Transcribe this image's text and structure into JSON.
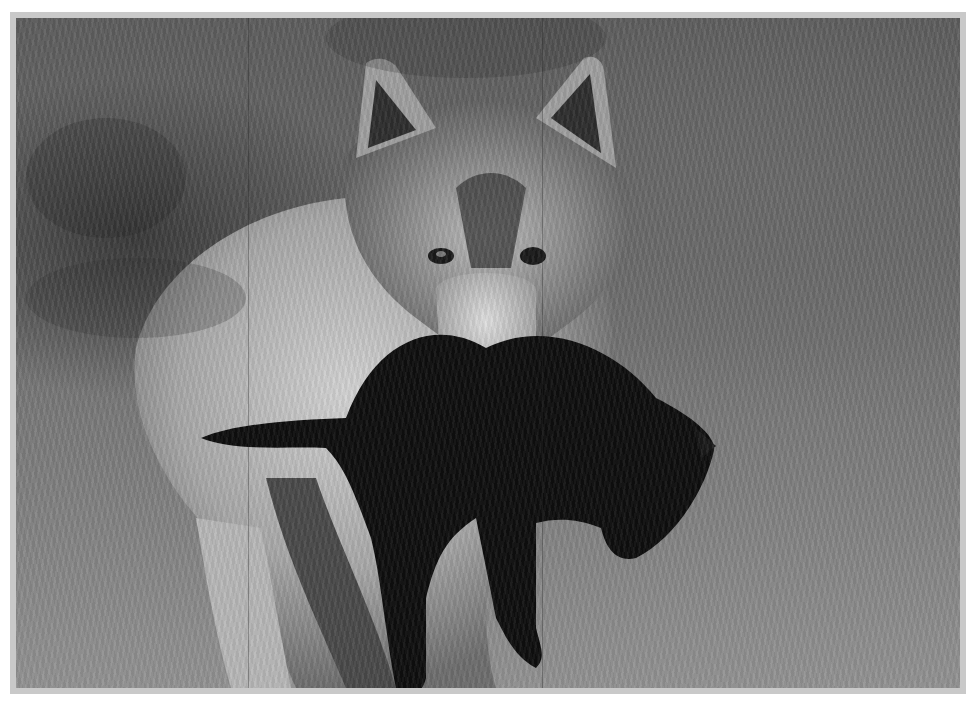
{
  "image": {
    "kind": "black-and-white photograph",
    "subject": "gray wolf carrying a dark wolf pup in its mouth",
    "setting": "grassy meadow with blurred dark background",
    "palette": {
      "frame": "#c9c9c9",
      "background_dark": "#3a3a3a",
      "background_mid": "#6b6b6b",
      "grass_light": "#8a8a8a",
      "wolf_fur_light": "#cfcfcf",
      "wolf_fur_mid": "#8c8c8c",
      "pup_dark": "#0e0e0e"
    },
    "elements": [
      {
        "name": "adult-wolf",
        "description": "wolf facing camera, ears up, light fur body"
      },
      {
        "name": "wolf-pup",
        "description": "black pup hanging from adult's jaws, head to the right, legs dangling"
      },
      {
        "name": "grass",
        "description": "tall grass in lower half, out of focus"
      }
    ]
  }
}
